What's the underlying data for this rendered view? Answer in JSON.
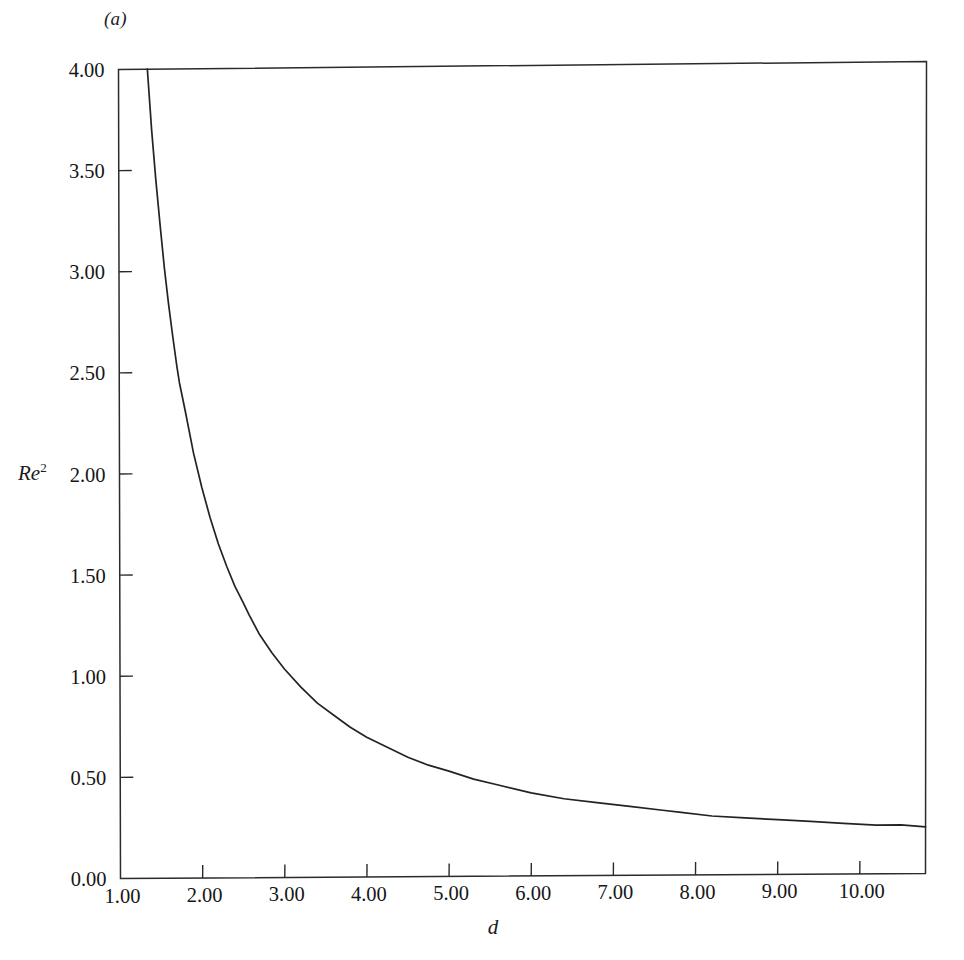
{
  "figure": {
    "panel_label": "(a)",
    "background_color": "#ffffff",
    "curve_color": "#232323",
    "axis_color": "#2b2b2b"
  },
  "chart_data": {
    "type": "line",
    "title": "",
    "panel": "(a)",
    "xlabel": "d",
    "ylabel": "Re^2",
    "ylabel_base": "Re",
    "ylabel_exponent": "2",
    "xlim": [
      1.0,
      10.8
    ],
    "ylim": [
      0.0,
      4.0
    ],
    "grid": false,
    "legend": null,
    "x_ticks": [
      1.0,
      2.0,
      3.0,
      4.0,
      5.0,
      6.0,
      7.0,
      8.0,
      9.0,
      10.0
    ],
    "x_tick_labels": [
      "1.00",
      "2.00",
      "3.00",
      "4.00",
      "5.00",
      "6.00",
      "7.00",
      "8.00",
      "9.00",
      "10.00"
    ],
    "y_ticks": [
      0.0,
      0.5,
      1.0,
      1.5,
      2.0,
      2.5,
      3.0,
      3.5,
      4.0
    ],
    "y_tick_labels": [
      "0.00",
      "0.50",
      "1.00",
      "1.50",
      "2.00",
      "2.50",
      "3.00",
      "3.50",
      "4.00"
    ],
    "series": [
      {
        "name": "neutral-stability-curve",
        "x": [
          1.35,
          1.4,
          1.45,
          1.5,
          1.55,
          1.6,
          1.65,
          1.7,
          1.73,
          1.8,
          1.9,
          2.0,
          2.1,
          2.2,
          2.3,
          2.4,
          2.5,
          2.57,
          2.7,
          2.85,
          3.0,
          3.2,
          3.4,
          3.6,
          3.8,
          4.0,
          4.25,
          4.5,
          4.75,
          5.0,
          5.3,
          5.6,
          6.0,
          6.4,
          6.8,
          7.2,
          7.6,
          7.8,
          8.2,
          8.6,
          9.0,
          9.4,
          9.8,
          10.2,
          10.5,
          10.8
        ],
        "y": [
          4.0,
          3.7,
          3.45,
          3.23,
          3.02,
          2.84,
          2.68,
          2.53,
          2.45,
          2.31,
          2.1,
          1.93,
          1.78,
          1.65,
          1.54,
          1.44,
          1.36,
          1.3,
          1.2,
          1.11,
          1.03,
          0.94,
          0.86,
          0.8,
          0.74,
          0.69,
          0.64,
          0.59,
          0.55,
          0.52,
          0.48,
          0.45,
          0.41,
          0.38,
          0.36,
          0.34,
          0.32,
          0.31,
          0.29,
          0.28,
          0.27,
          0.26,
          0.25,
          0.24,
          0.24,
          0.23
        ]
      }
    ],
    "curve_form": "Re^2 = 1.85 / (d - 0.70)"
  }
}
